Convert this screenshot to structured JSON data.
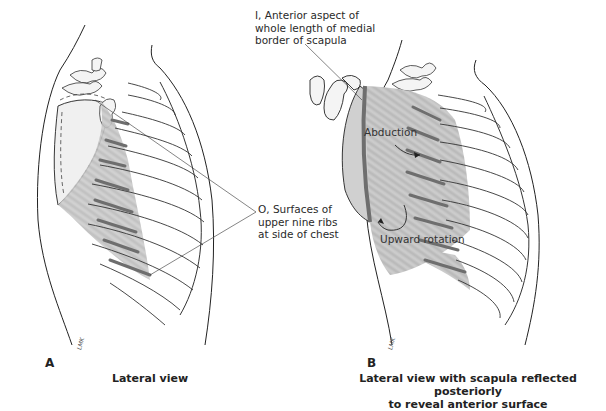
{
  "figure": {
    "panels": [
      {
        "letter": "A",
        "caption": "Lateral view",
        "signature": "LMK"
      },
      {
        "letter": "B",
        "caption_line1": "Lateral view with scapula reflected posteriorly",
        "caption_line2": "to reveal anterior surface",
        "signature": "LMK"
      }
    ],
    "labels": {
      "insertion_line1": "I, Anterior aspect of",
      "insertion_line2": "whole length of medial",
      "insertion_line3": "border of scapula",
      "origin_line1": "O, Surfaces of",
      "origin_line2": "upper nine ribs",
      "origin_line3": "at side of chest"
    },
    "actions": {
      "abduction": "Abduction",
      "upward_rotation": "Upward rotation"
    },
    "colors": {
      "muscle": "#b8b8b8",
      "muscle_dark": "#6e6e6e",
      "outline": "#222222",
      "bone": "#f4f4f4"
    }
  }
}
